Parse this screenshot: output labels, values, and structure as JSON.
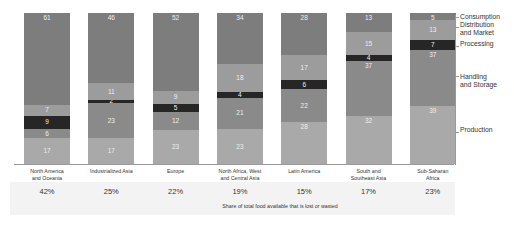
{
  "chart_data": {
    "type": "bar",
    "stacked": true,
    "percent_stacked": true,
    "title": "",
    "xlabel": "Share of total food available that is lost or wasted",
    "ylabel": "",
    "ylim": [
      0,
      100
    ],
    "grid": false,
    "legend_position": "right",
    "categories": [
      "North America and Oceania",
      "Industrialized Asia",
      "Europe",
      "North Africa, West and Central Asia",
      "Latin America",
      "South and Southeast Asia",
      "Sub-Saharan Africa"
    ],
    "category_label_lines": [
      [
        "North America",
        "and Oceania"
      ],
      [
        "Industrialized Asia"
      ],
      [
        "Europe"
      ],
      [
        "North Africa, West",
        "and Central Asia"
      ],
      [
        "Latin America"
      ],
      [
        "South and",
        "Southeast Asia"
      ],
      [
        "Sub-Saharan",
        "Africa"
      ]
    ],
    "series": [
      {
        "name": "Production",
        "color": "#a9a9a9",
        "values": [
          17,
          17,
          23,
          23,
          28,
          32,
          39
        ]
      },
      {
        "name": "Handling and Storage",
        "color": "#8a8a8a",
        "values": [
          6,
          23,
          12,
          21,
          22,
          37,
          37
        ]
      },
      {
        "name": "Processing",
        "color": "#262626",
        "values": [
          9,
          2,
          5,
          4,
          6,
          4,
          7
        ]
      },
      {
        "name": "Distribution and Market",
        "color": "#9c9c9c",
        "values": [
          7,
          11,
          9,
          18,
          17,
          15,
          13
        ]
      },
      {
        "name": "Consumption",
        "color": "#7d7d7d",
        "values": [
          61,
          46,
          52,
          34,
          28,
          13,
          5
        ]
      }
    ],
    "share_lost_or_wasted": [
      "42%",
      "25%",
      "22%",
      "19%",
      "15%",
      "17%",
      "23%"
    ]
  },
  "legend": [
    {
      "label_lines": [
        "Consumption"
      ]
    },
    {
      "label_lines": [
        "Distribution",
        "and Market"
      ]
    },
    {
      "label_lines": [
        "Processing"
      ]
    },
    {
      "label_lines": [
        "Handling",
        "and Storage"
      ]
    },
    {
      "label_lines": [
        "Production"
      ]
    }
  ],
  "footnote": "Share of total food available that is lost or wasted"
}
